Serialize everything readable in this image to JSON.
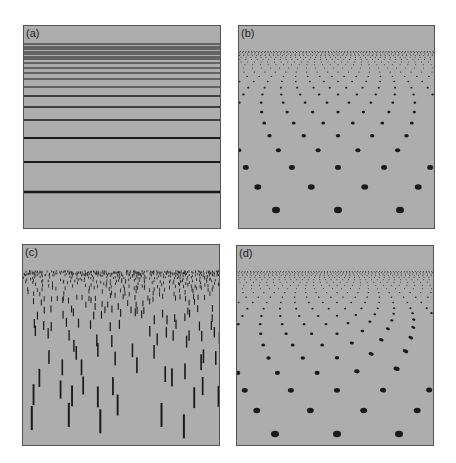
{
  "figure": {
    "panels": [
      {
        "id": "a",
        "label": "(a)",
        "texture": "horizontal-lines"
      },
      {
        "id": "b",
        "label": "(b)",
        "texture": "dot-lattice-perspective"
      },
      {
        "id": "c",
        "label": "(c)",
        "texture": "vertical-bar-field-perspective"
      },
      {
        "id": "d",
        "label": "(d)",
        "texture": "dot-lattice-perspective-distorted"
      }
    ]
  },
  "colors": {
    "background": "#adadad",
    "ink": "#1a1a1a",
    "border": "#555555"
  },
  "chart_data": {
    "type": "diagram",
    "title": "",
    "panels": {
      "a": {
        "line_y_abs": [
          43,
          46,
          48,
          51,
          53,
          56,
          58,
          62,
          67,
          72,
          78,
          86,
          95,
          106,
          119,
          137,
          161,
          191
        ],
        "line_widths": [
          1,
          1,
          1,
          1,
          1,
          1,
          1,
          1,
          1,
          1,
          1.2,
          1.2,
          1.3,
          1.4,
          1.6,
          1.8,
          2.1,
          2.5
        ]
      },
      "b": {
        "horizon_y": 18,
        "near_row_y": 184,
        "rows": 22,
        "near_spacing_x": 62,
        "near_radius": 4,
        "center_x": 99
      },
      "c": {
        "horizon_y": 18,
        "near_row_y": 166,
        "rows": 22,
        "near_bar_height": 24,
        "near_bar_width": 2,
        "near_spacing_x": 30,
        "seed": 7
      },
      "d": {
        "horizon_y": 18,
        "near_row_y": 188,
        "rows": 22,
        "near_spacing_x": 62,
        "near_radius": 4,
        "center_x": 100,
        "distortion_region": "right-middle"
      }
    }
  }
}
